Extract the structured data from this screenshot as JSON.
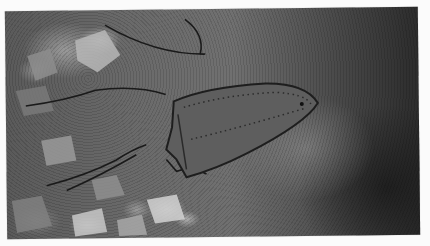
{
  "image": {
    "description": "Grayscale photograph of a rusted clothes-iron soleplate lying on rubble-strewn ground",
    "subject": "rusted iron soleplate with perforated steam holes",
    "background": "rocky debris, dirt and twigs",
    "tone": "black-and-white",
    "colors": {
      "page_background": "#fbfbfb",
      "ground_mid": "#6a6a6a",
      "ground_dark": "#2c2c2c",
      "iron_body": "#5e5e5e",
      "iron_outline": "#1e1e1e"
    }
  }
}
